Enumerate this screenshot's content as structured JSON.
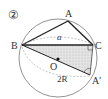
{
  "diagram": {
    "number_label": "②",
    "points": {
      "A": "A",
      "B": "B",
      "C": "C",
      "O": "O",
      "A_prime": "A'"
    },
    "side_label": "a",
    "diameter_label": "2R",
    "colors": {
      "line": "#333333",
      "circle": "#666666",
      "shade": "#d9d9d9",
      "dashed": "#999999"
    }
  }
}
